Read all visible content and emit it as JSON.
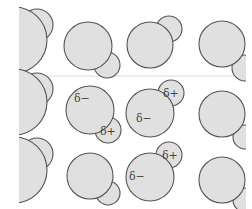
{
  "figure": {
    "colors": {
      "atom_fill": "#e0e0e0",
      "atom_stroke": "#555555",
      "background": "#ffffff",
      "divider": "#d0d0d0"
    },
    "labels": {
      "delta_minus": "δ−",
      "delta_plus": "δ+",
      "delta_plus_faded": "δ+"
    },
    "molecules": [
      {
        "row": 1,
        "col": 1,
        "big": {
          "cx": 14,
          "cy": 40,
          "r": 33
        },
        "small": {
          "cx": 37,
          "cy": 25,
          "r": 16
        },
        "labels": []
      },
      {
        "row": 1,
        "col": 2,
        "big": {
          "cx": 88,
          "cy": 46,
          "r": 24
        },
        "small": {
          "cx": 107,
          "cy": 65,
          "r": 13
        },
        "labels": []
      },
      {
        "row": 1,
        "col": 3,
        "big": {
          "cx": 150,
          "cy": 45,
          "r": 23
        },
        "small": {
          "cx": 169,
          "cy": 29,
          "r": 13
        },
        "labels": []
      },
      {
        "row": 1,
        "col": 4,
        "big": {
          "cx": 222,
          "cy": 44,
          "r": 23
        },
        "small": {
          "cx": 245,
          "cy": 68,
          "r": 13
        },
        "labels": []
      },
      {
        "row": 2,
        "col": 1,
        "big": {
          "cx": 14,
          "cy": 102,
          "r": 33
        },
        "small": {
          "cx": 37,
          "cy": 89,
          "r": 16
        },
        "labels": []
      },
      {
        "row": 2,
        "col": 2,
        "big": {
          "cx": 90,
          "cy": 110,
          "r": 24
        },
        "small": {
          "cx": 108,
          "cy": 130,
          "r": 13
        },
        "labels": [
          "delta_minus",
          "delta_plus"
        ]
      },
      {
        "row": 2,
        "col": 3,
        "big": {
          "cx": 150,
          "cy": 113,
          "r": 24
        },
        "small": {
          "cx": 171,
          "cy": 93,
          "r": 13
        },
        "labels": [
          "delta_minus",
          "delta_plus"
        ]
      },
      {
        "row": 2,
        "col": 4,
        "big": {
          "cx": 222,
          "cy": 114,
          "r": 23
        },
        "small": {
          "cx": 245,
          "cy": 137,
          "r": 12
        },
        "labels": []
      },
      {
        "row": 3,
        "col": 1,
        "big": {
          "cx": 14,
          "cy": 170,
          "r": 33
        },
        "small": {
          "cx": 37,
          "cy": 154,
          "r": 16
        },
        "labels": []
      },
      {
        "row": 3,
        "col": 2,
        "big": {
          "cx": 90,
          "cy": 176,
          "r": 23
        },
        "small": {
          "cx": 108,
          "cy": 193,
          "r": 12
        },
        "labels": []
      },
      {
        "row": 3,
        "col": 3,
        "big": {
          "cx": 150,
          "cy": 177,
          "r": 24
        },
        "small": {
          "cx": 169,
          "cy": 155,
          "r": 13
        },
        "labels": [
          "delta_minus",
          "delta_plus_faded"
        ]
      },
      {
        "row": 3,
        "col": 4,
        "big": {
          "cx": 222,
          "cy": 180,
          "r": 23
        },
        "small": {
          "cx": 245,
          "cy": 200,
          "r": 12
        },
        "labels": []
      }
    ]
  }
}
